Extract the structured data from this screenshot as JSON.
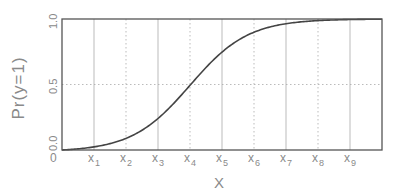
{
  "chart_data": {
    "type": "line",
    "title": "",
    "xlabel": "X",
    "ylabel": "Pr(y=1)",
    "x_origin_label": "0",
    "x_ticks": [
      {
        "base": "x",
        "sub": "1"
      },
      {
        "base": "x",
        "sub": "2"
      },
      {
        "base": "x",
        "sub": "3"
      },
      {
        "base": "x",
        "sub": "4"
      },
      {
        "base": "x",
        "sub": "5"
      },
      {
        "base": "x",
        "sub": "6"
      },
      {
        "base": "x",
        "sub": "7"
      },
      {
        "base": "x",
        "sub": "8"
      },
      {
        "base": "x",
        "sub": "9"
      }
    ],
    "y_ticks": [
      "0.0",
      "0.5",
      "1.0"
    ],
    "ylim": [
      0,
      1
    ],
    "xlim": [
      0,
      10
    ],
    "grid": true,
    "grid_style": "alternating solid/dotted vertical lines; dotted horizontal at 0.5",
    "legend": null,
    "series": [
      {
        "name": "logistic",
        "description": "S-shaped logistic curve, Pr(y=1)=0.5 at x4",
        "x": [
          0,
          1,
          2,
          3,
          4,
          5,
          6,
          7,
          8,
          9,
          10
        ],
        "values": [
          0.0,
          0.02,
          0.09,
          0.25,
          0.5,
          0.75,
          0.91,
          0.98,
          1.0,
          1.0,
          1.0
        ]
      }
    ],
    "colors": {
      "curve": "#444444",
      "frame": "#555555",
      "grid": "#aaaaaa",
      "text": "#8a8a8a"
    }
  }
}
